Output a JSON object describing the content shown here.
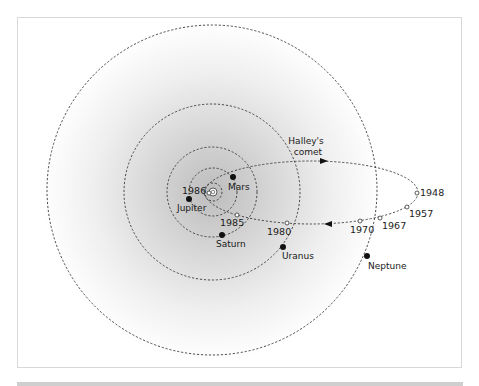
{
  "diagram": {
    "comet_label_line1": "Halley's",
    "comet_label_line2": "comet",
    "colors": {
      "orbit": "#333333",
      "planet": "#111111",
      "glow_center": "#c4c4c4",
      "background": "#ffffff"
    },
    "planets": [
      {
        "name": "Mars",
        "x": 233,
        "y": 177,
        "orbit_r": 24
      },
      {
        "name": "Jupiter",
        "x": 189,
        "y": 199,
        "orbit_r": 24
      },
      {
        "name": "Saturn",
        "x": 222,
        "y": 235,
        "orbit_r": 45
      },
      {
        "name": "Uranus",
        "x": 283,
        "y": 247,
        "orbit_r": 89
      },
      {
        "name": "Neptune",
        "x": 367,
        "y": 256,
        "orbit_r": 167
      }
    ],
    "years": [
      {
        "label": "1986",
        "x": 209,
        "y": 193
      },
      {
        "label": "1985",
        "x": 237,
        "y": 215
      },
      {
        "label": "1980",
        "x": 287,
        "y": 223
      },
      {
        "label": "1970",
        "x": 360,
        "y": 221
      },
      {
        "label": "1967",
        "x": 380,
        "y": 218
      },
      {
        "label": "1957",
        "x": 407,
        "y": 207
      },
      {
        "label": "1948",
        "x": 417,
        "y": 193
      }
    ]
  }
}
